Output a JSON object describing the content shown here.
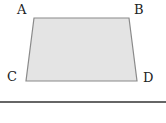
{
  "diagram": {
    "type": "quadrilateral",
    "shape": "trapezoid",
    "vertices": [
      {
        "label": "A",
        "position": "top-left"
      },
      {
        "label": "B",
        "position": "top-right"
      },
      {
        "label": "C",
        "position": "bottom-left"
      },
      {
        "label": "D",
        "position": "bottom-right"
      }
    ],
    "fill_color": "#e4e4e4",
    "stroke_color": "#8a8a8a",
    "baseline_color": "#333333"
  }
}
